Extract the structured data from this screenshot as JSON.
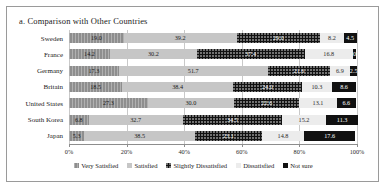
{
  "chart_title": "a. Comparison with Other Countries",
  "axis": {
    "xticks": [
      "0%",
      "20%",
      "40%",
      "60%",
      "80%",
      "100%"
    ],
    "xtick_values": [
      0,
      20,
      40,
      60,
      80,
      100
    ]
  },
  "legend": [
    {
      "label": "Very Satisfied",
      "swatch": "#8e8e8e",
      "pattern": "p0"
    },
    {
      "label": "Satisfied",
      "swatch": "#c6c6c6",
      "pattern": "p1"
    },
    {
      "label": "Slightly Dissatisfied",
      "swatch": "#111111",
      "pattern": "p2"
    },
    {
      "label": "Dissatisfied",
      "swatch": "#ececec",
      "pattern": "p3"
    },
    {
      "label": "Not sure",
      "swatch": "#111111",
      "pattern": "p4"
    }
  ],
  "chart_data": {
    "type": "bar",
    "orientation": "horizontal",
    "stacked": true,
    "stack_mode": "percent",
    "title": "a. Comparison with Other Countries",
    "xlabel": "",
    "ylabel": "",
    "xlim": [
      0,
      100
    ],
    "grid": true,
    "legend_position": "bottom",
    "categories": [
      "Sweden",
      "France",
      "Germany",
      "Britain",
      "United States",
      "South Korea",
      "Japan"
    ],
    "series": [
      {
        "name": "Very Satisfied",
        "values": [
          19.0,
          14.2,
          17.3,
          18.5,
          27.3,
          6.8,
          5.3
        ]
      },
      {
        "name": "Satisfied",
        "values": [
          39.2,
          30.2,
          51.7,
          38.4,
          30.0,
          32.7,
          38.5
        ]
      },
      {
        "name": "Slightly Dissatisfied",
        "values": [
          29.0,
          37.4,
          21.6,
          24.0,
          22.6,
          34.5,
          23.1
        ]
      },
      {
        "name": "Dissatisfied",
        "values": [
          8.2,
          16.8,
          6.9,
          10.3,
          13.1,
          15.2,
          14.8
        ]
      },
      {
        "name": "Not sure",
        "values": [
          4.5,
          0.9,
          2.5,
          8.6,
          6.6,
          11.3,
          17.6
        ]
      }
    ],
    "data_labels": [
      [
        "19.0",
        "39.2",
        "29.0",
        "8.2",
        "4.5"
      ],
      [
        "14.2",
        "30.2",
        "37.4",
        "16.8",
        "0.9"
      ],
      [
        "17.3",
        "51.7",
        "21.6",
        "6.9",
        "2.5"
      ],
      [
        "18.5",
        "38.4",
        "24.0",
        "10.3",
        "8.6"
      ],
      [
        "27.3",
        "30.0",
        "22.6",
        "13.1",
        "6.6"
      ],
      [
        "6.8",
        "32.7",
        "34.5",
        "15.2",
        "11.3"
      ],
      [
        "5.3",
        "38.5",
        "23.1",
        "14.8",
        "17.6"
      ]
    ]
  }
}
